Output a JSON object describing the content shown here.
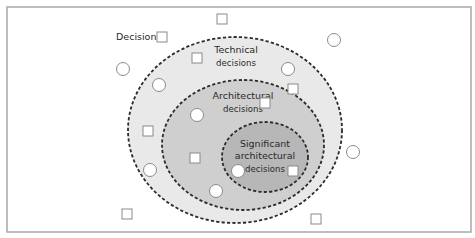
{
  "diagram": {
    "title_label": "Decision",
    "frame": {
      "x": 7,
      "y": 7,
      "w": 464,
      "h": 225,
      "stroke": "#a8a8a8"
    },
    "regions": [
      {
        "id": "technical",
        "label_line1": "Technical",
        "label_line2": "decisions",
        "cx": 235,
        "cy": 130,
        "rx": 107,
        "ry": 93,
        "fill": "#e9e9e9"
      },
      {
        "id": "architectural",
        "label_line1": "Architectural",
        "label_line2": "decisions",
        "cx": 243,
        "cy": 145,
        "rx": 81,
        "ry": 65,
        "fill": "#cfcfcf"
      },
      {
        "id": "significant",
        "label_line1": "Significant",
        "label_line2": "architectural",
        "label_line3": "decisions",
        "cx": 265,
        "cy": 157,
        "rx": 43,
        "ry": 35,
        "fill": "#b7b7b7"
      }
    ],
    "legend": {
      "shape": "square",
      "label": "Decision"
    },
    "squares": [
      {
        "x": 222,
        "y": 19,
        "region": "outside"
      },
      {
        "x": 162,
        "y": 37,
        "region": "outside"
      },
      {
        "x": 197,
        "y": 58,
        "region": "technical"
      },
      {
        "x": 148,
        "y": 131,
        "region": "technical"
      },
      {
        "x": 293,
        "y": 89,
        "region": "architectural"
      },
      {
        "x": 265,
        "y": 103,
        "region": "significant"
      },
      {
        "x": 195,
        "y": 158,
        "region": "architectural"
      },
      {
        "x": 293,
        "y": 171,
        "region": "significant"
      },
      {
        "x": 127,
        "y": 214,
        "region": "outside"
      },
      {
        "x": 316,
        "y": 219,
        "region": "outside"
      }
    ],
    "circles": [
      {
        "x": 123,
        "y": 69,
        "region": "outside"
      },
      {
        "x": 334,
        "y": 40,
        "region": "outside"
      },
      {
        "x": 159,
        "y": 85,
        "region": "technical"
      },
      {
        "x": 288,
        "y": 69,
        "region": "technical"
      },
      {
        "x": 197,
        "y": 115,
        "region": "architectural"
      },
      {
        "x": 353,
        "y": 152,
        "region": "outside"
      },
      {
        "x": 150,
        "y": 170,
        "region": "technical"
      },
      {
        "x": 238,
        "y": 171,
        "region": "significant"
      },
      {
        "x": 216,
        "y": 191,
        "region": "architectural"
      }
    ],
    "colors": {
      "shape_stroke": "#8a8a8a",
      "shape_fill": "#ffffff",
      "dash_stroke": "#2b2b2b",
      "text": "#2a2a2a"
    }
  }
}
